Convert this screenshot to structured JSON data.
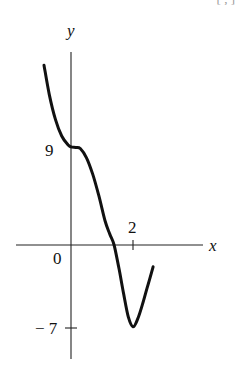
{
  "header": {
    "clipped_text": "[ , ]"
  },
  "chart_data": {
    "type": "line",
    "title": "",
    "xlabel": "x",
    "ylabel": "y",
    "origin_label": "0",
    "x_ticks": [
      {
        "value": 2,
        "label": "2"
      }
    ],
    "y_ticks": [
      {
        "value": 9,
        "label": "9"
      },
      {
        "value": -7,
        "label": "-7"
      }
    ],
    "xlim": [
      -1.8,
      4.2
    ],
    "ylim": [
      -10,
      19
    ],
    "grid": false,
    "legend": null,
    "series": [
      {
        "name": "f(x)",
        "x": [
          -0.87,
          -0.7,
          -0.5,
          -0.3,
          -0.1,
          0.0,
          0.15,
          0.3,
          0.5,
          0.7,
          0.9,
          1.1,
          1.25,
          1.39,
          1.55,
          1.7,
          1.85,
          2.0,
          2.15,
          2.3,
          2.45,
          2.65
        ],
        "y": [
          16.5,
          13.8,
          11.5,
          10.0,
          9.2,
          9.0,
          8.95,
          8.85,
          8.0,
          6.5,
          4.5,
          2.2,
          1.0,
          0.0,
          -2.2,
          -4.5,
          -6.6,
          -7.5,
          -6.8,
          -5.5,
          -4.0,
          -2.0
        ]
      }
    ],
    "annotations": [
      {
        "text": "9",
        "at": [
          0,
          9
        ]
      },
      {
        "text": "-7",
        "at": [
          0,
          -7
        ]
      },
      {
        "text": "2",
        "at": [
          2,
          0
        ]
      }
    ]
  }
}
